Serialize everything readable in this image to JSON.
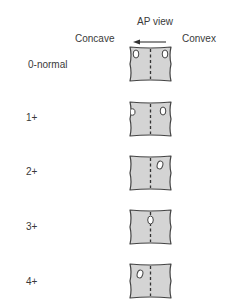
{
  "header": {
    "view_label": "AP view",
    "left_label": "Concave",
    "right_label": "Convex",
    "arrow_direction": "left"
  },
  "colors": {
    "body_fill": "#d4d4d4",
    "outline": "#444444",
    "pedicle_fill": "#ffffff",
    "text": "#3a3a3a"
  },
  "grades": [
    {
      "label": "0-normal",
      "description": "Both pedicles symmetric at lateral margins"
    },
    {
      "label": "1+",
      "description": "Convex pedicle migrates slightly toward midline, concave pedicle shrinking"
    },
    {
      "label": "2+",
      "description": "Convex pedicle between margin and midline, concave pedicle disappears"
    },
    {
      "label": "3+",
      "description": "Convex pedicle at midline"
    },
    {
      "label": "4+",
      "description": "Convex pedicle past midline toward concave side"
    }
  ]
}
